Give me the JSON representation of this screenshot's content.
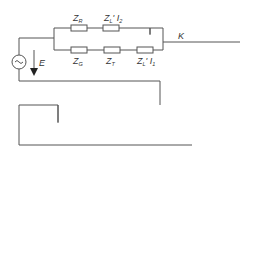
{
  "diagram": {
    "type": "circuit",
    "source": {
      "symbol": "~",
      "label": "E"
    },
    "nodes": {
      "k1": "K",
      "k2": "K",
      "k3": "K"
    },
    "branch1": {
      "top": [
        {
          "z": "Z",
          "s": "R"
        },
        {
          "z": "Z",
          "s": "L",
          "tail": "' I",
          "tsub": "2"
        }
      ],
      "bottom": [
        {
          "z": "Z",
          "s": "G"
        },
        {
          "z": "Z",
          "s": "T"
        },
        {
          "z": "Z",
          "s": "L",
          "tail": "' I",
          "tsub": "1"
        }
      ]
    },
    "branch2": {
      "top": [
        {
          "z": "Z",
          "s": "R"
        },
        {
          "z": "Z",
          "s": "L",
          "tail": "' I",
          "tsub": "2"
        }
      ],
      "bottom": [
        {
          "z": "Z",
          "s": "G"
        },
        {
          "z": "Z",
          "s": "T"
        },
        {
          "z": "Z",
          "s": "L",
          "tail": "' I",
          "tsub": "1"
        }
      ]
    },
    "pi2": {
      "series": {
        "z": "Z",
        "s": "L0",
        "tail": "' I",
        "tsub": "2"
      },
      "return": {
        "z": "3R",
        "s": "E",
        "tail": "' I",
        "tsub": "2"
      },
      "cap_left": {
        "num": "C",
        "nsub": "0",
        "den": "2",
        "tail": "' I",
        "tsub": "2"
      },
      "cap_right": {
        "num": "C",
        "nsub": "0",
        "den": "2",
        "tail": "' I",
        "tsub": "2"
      }
    },
    "pi1": {
      "series": {
        "z": "Z",
        "s": "L0",
        "tail": "' I",
        "tsub": "1"
      },
      "return": {
        "z": "3R",
        "s": "E",
        "tail": "' I",
        "tsub": "1"
      },
      "cap_left": {
        "num": "C",
        "nsub": "0",
        "den": "2",
        "tail": "' I",
        "tsub": "1"
      },
      "cap_right": {
        "num": "C",
        "nsub": "0",
        "den": "2",
        "tail": "' I",
        "tsub": "1"
      }
    },
    "fault": {
      "z": "3R",
      "s": "EK"
    },
    "current": {
      "lhs": "I",
      "lsub": "1",
      "eq": "=",
      "num": "I",
      "nsub": "E",
      "den": "3"
    }
  }
}
